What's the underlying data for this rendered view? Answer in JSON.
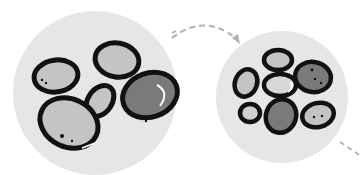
{
  "illustration": {
    "description": "Two groups of pebbles: large pebbles in a circle transforming into many smaller pebbles in another circle, connected by a dashed curved arrow",
    "colors": {
      "background": "#ffffff",
      "circle_fill": "#e6e6e6",
      "outline": "#111111",
      "light_stone": "#c4c4c4",
      "dark_stone": "#7a7a7a",
      "arrow": "#b0b0b0"
    },
    "left_group": {
      "stone_count": 5
    },
    "right_group": {
      "stone_count": 8
    },
    "arrow": {
      "style": "dashed",
      "direction": "left-to-right"
    }
  }
}
